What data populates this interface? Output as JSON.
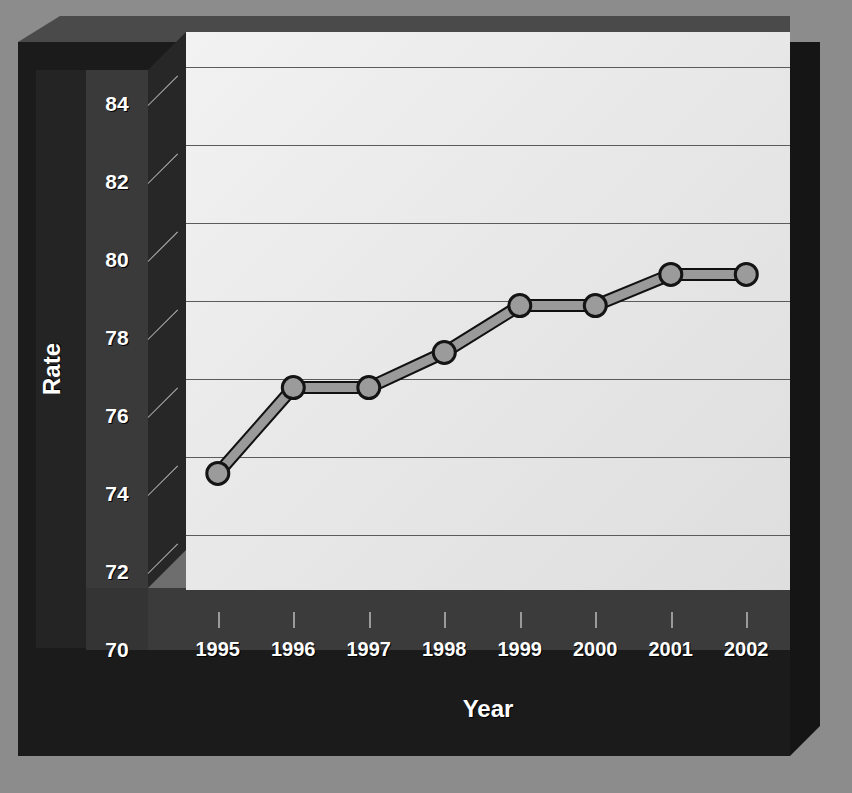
{
  "chart_data": {
    "type": "line",
    "title": "",
    "xlabel": "Year",
    "ylabel": "Rate",
    "categories": [
      "1995",
      "1996",
      "1997",
      "1998",
      "1999",
      "2000",
      "2001",
      "2002"
    ],
    "values": [
      75.1,
      77.3,
      77.3,
      78.2,
      79.4,
      79.4,
      80.2,
      80.2
    ],
    "series": [
      {
        "name": "Rate",
        "values": [
          75.1,
          77.3,
          77.3,
          78.2,
          79.4,
          79.4,
          80.2,
          80.2
        ]
      }
    ],
    "ylim": [
      70,
      85
    ],
    "ytick_labels": [
      "84",
      "82",
      "80",
      "78",
      "76",
      "74",
      "72",
      "70"
    ],
    "ytick_values": [
      84,
      82,
      80,
      78,
      76,
      74,
      72,
      70
    ],
    "gridlines": [
      85,
      83,
      81,
      79,
      77,
      75,
      73
    ],
    "grid": true,
    "legend": "none",
    "style": "3d-perspective"
  },
  "axes": {
    "y_title": "Rate",
    "x_title": "Year"
  },
  "colors": {
    "background": "#8c8c8c",
    "frame": "#1b1b1b",
    "plot_area": "#ececec",
    "gridline": "#5b5b5b",
    "series_line": "#8f8f8f",
    "series_outline": "#1a1a1a",
    "marker_fill": "#9b9b9b",
    "label_text": "#ffffff"
  }
}
